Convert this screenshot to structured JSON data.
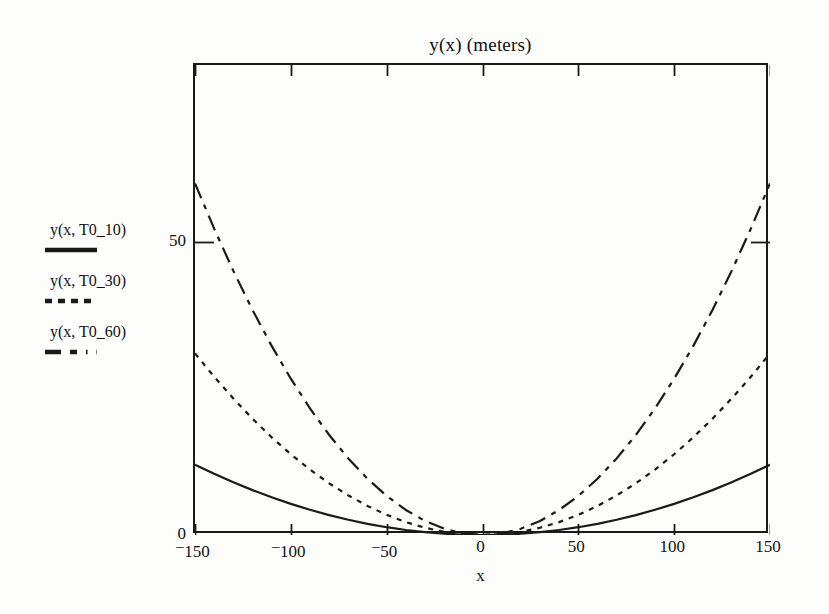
{
  "chart_data": {
    "type": "line",
    "title": "y(x) (meters)",
    "xlabel": "x",
    "ylabel": "",
    "xlim": [
      -150,
      150
    ],
    "ylim": [
      0,
      80.2
    ],
    "xticks": [
      -150,
      -100,
      -50,
      0,
      50,
      100,
      150
    ],
    "xtick_labels": [
      "-150",
      "-100",
      "-50",
      "0",
      "50",
      "100",
      "150"
    ],
    "yticks": [
      0,
      50
    ],
    "ytick_labels": [
      "0",
      "50"
    ],
    "grid": false,
    "legend_position": "left-outside",
    "frame": "box",
    "tick_direction": "in",
    "line_color": "#1a1a1a",
    "background_color": "#fdfdfc",
    "x": [
      -150,
      -140,
      -130,
      -120,
      -110,
      -100,
      -90,
      -80,
      -70,
      -60,
      -50,
      -40,
      -30,
      -20,
      -10,
      0,
      10,
      20,
      30,
      40,
      50,
      60,
      70,
      80,
      90,
      100,
      110,
      120,
      130,
      140,
      150
    ],
    "series": [
      {
        "name": "y(x, T0_10)",
        "label": "y(x, T0_10)",
        "linestyle": "solid",
        "values": [
          12.0,
          10.45,
          9.0,
          7.66,
          6.43,
          5.31,
          4.3,
          3.4,
          2.6,
          1.91,
          1.33,
          0.85,
          0.48,
          0.21,
          0.05,
          0.0,
          0.05,
          0.21,
          0.48,
          0.85,
          1.33,
          1.91,
          2.6,
          3.4,
          4.3,
          5.31,
          6.43,
          7.66,
          9.0,
          10.45,
          12.0
        ]
      },
      {
        "name": "y(x, T0_30)",
        "label": "y(x, T0_30)",
        "linestyle": "dotted",
        "values": [
          31.0,
          27.0,
          23.3,
          19.84,
          16.67,
          13.78,
          11.16,
          8.82,
          6.75,
          4.96,
          3.44,
          2.2,
          1.24,
          0.55,
          0.14,
          0.0,
          0.14,
          0.55,
          1.24,
          2.2,
          3.44,
          4.96,
          6.75,
          8.82,
          11.16,
          13.78,
          16.67,
          19.84,
          23.3,
          27.0,
          31.0
        ]
      },
      {
        "name": "y(x, T0_60)",
        "label": "y(x, T0_60)",
        "linestyle": "dashdot",
        "values": [
          60.0,
          52.27,
          45.07,
          38.4,
          32.27,
          26.67,
          21.6,
          17.07,
          13.07,
          9.6,
          6.67,
          4.27,
          2.4,
          1.07,
          0.27,
          0.0,
          0.27,
          1.07,
          2.4,
          4.27,
          6.67,
          9.6,
          13.07,
          17.07,
          21.6,
          26.67,
          32.27,
          38.4,
          45.07,
          52.27,
          60.0
        ]
      }
    ]
  }
}
